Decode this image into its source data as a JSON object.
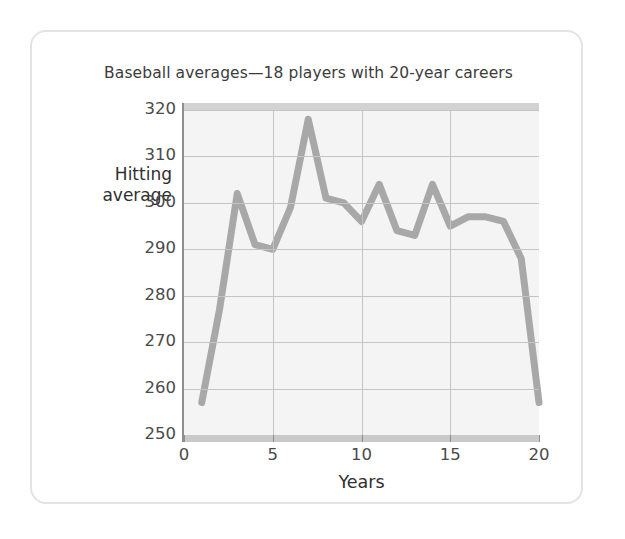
{
  "card": {
    "title": "Baseball averages—18 players with 20-year careers"
  },
  "axis": {
    "y_title_line1": "Hitting",
    "y_title_line2": "average",
    "x_title": "Years"
  },
  "chart_data": {
    "type": "line",
    "title": "Baseball averages—18 players with 20-year careers",
    "xlabel": "Years",
    "ylabel": "Hitting average",
    "xlim": [
      0,
      20
    ],
    "ylim": [
      250,
      320
    ],
    "xticks": [
      0,
      5,
      10,
      15,
      20
    ],
    "yticks": [
      250,
      260,
      270,
      280,
      290,
      300,
      310,
      320
    ],
    "grid": true,
    "legend": null,
    "series": [
      {
        "name": "Hitting average",
        "color": "#a8a8a8",
        "x": [
          1,
          2,
          3,
          4,
          5,
          6,
          7,
          8,
          9,
          10,
          11,
          12,
          13,
          14,
          15,
          16,
          17,
          18,
          19,
          20
        ],
        "values": [
          257,
          277,
          302,
          291,
          290,
          299,
          318,
          301,
          300,
          296,
          304,
          294,
          293,
          304,
          295,
          297,
          297,
          296,
          288,
          257
        ]
      }
    ]
  },
  "colors": {
    "line": "#a8a8a8",
    "grid": "#c4c4c4",
    "plot_bg": "#f4f4f4",
    "card_border": "#e3e3e3",
    "text": "#3c3c3c"
  }
}
